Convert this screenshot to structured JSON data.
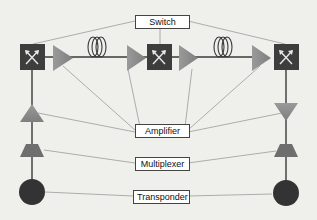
{
  "diagram": {
    "type": "optical-network-topology",
    "colors": {
      "background": "#efefec",
      "switch_fill": "#3d3d3d",
      "switch_icon": "#e8e8e8",
      "amplifier_fill": "#8f8f8f",
      "multiplexer_fill": "#6e6e6e",
      "transponder_fill": "#333333",
      "link_line": "#3a3a3a",
      "leader_line": "#9a9a9a",
      "label_border": "#444444"
    },
    "labels": {
      "switch": "Switch",
      "amplifier": "Amplifier",
      "multiplexer": "Multiplexer",
      "transponder": "Transponder"
    },
    "nodes": {
      "switches": [
        {
          "id": "switch-left",
          "icon": "cross-arrows-icon"
        },
        {
          "id": "switch-center",
          "icon": "cross-arrows-icon"
        },
        {
          "id": "switch-right",
          "icon": "cross-arrows-icon"
        }
      ],
      "amplifiers": [
        {
          "id": "amp-1",
          "orientation": "right"
        },
        {
          "id": "amp-2",
          "orientation": "right"
        },
        {
          "id": "amp-3",
          "orientation": "right"
        },
        {
          "id": "amp-4",
          "orientation": "right"
        },
        {
          "id": "amp-left-vertical",
          "orientation": "up"
        },
        {
          "id": "amp-right-vertical",
          "orientation": "down"
        }
      ],
      "fiber_spools": [
        {
          "id": "fiber-left",
          "loops": 3
        },
        {
          "id": "fiber-right",
          "loops": 3
        }
      ],
      "multiplexers": [
        {
          "id": "mux-left"
        },
        {
          "id": "mux-right"
        }
      ],
      "transponders": [
        {
          "id": "transponder-left"
        },
        {
          "id": "transponder-right"
        }
      ]
    }
  }
}
